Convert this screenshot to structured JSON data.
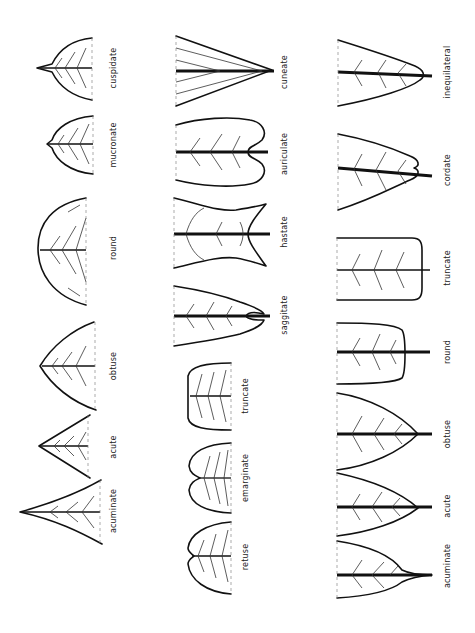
{
  "figure": {
    "orientation": "rotated 90 degrees counter-clockwise",
    "colors": {
      "ink": "#111111",
      "background": "#ffffff"
    },
    "column_1": {
      "group": "apex shapes",
      "items": [
        {
          "label": "cuspidate"
        },
        {
          "label": "mucronate"
        },
        {
          "label": "round"
        },
        {
          "label": "obtuse"
        },
        {
          "label": "acute"
        },
        {
          "label": "acuminate"
        }
      ]
    },
    "column_2_top": {
      "group": "base shapes",
      "items": [
        {
          "label": "cuneate"
        },
        {
          "label": "auriculate"
        },
        {
          "label": "hastate"
        },
        {
          "label": "saggitate"
        }
      ]
    },
    "column_2_bottom": {
      "group": "apex shapes (notched/flat)",
      "items": [
        {
          "label": "truncate"
        },
        {
          "label": "emarginate"
        },
        {
          "label": "retuse"
        }
      ]
    },
    "column_3": {
      "group": "base shapes",
      "items": [
        {
          "label": "inequilateral"
        },
        {
          "label": "cordate"
        },
        {
          "label": "truncate"
        },
        {
          "label": "round"
        },
        {
          "label": "obtuse"
        },
        {
          "label": "acute"
        },
        {
          "label": "acuminate"
        }
      ]
    }
  }
}
